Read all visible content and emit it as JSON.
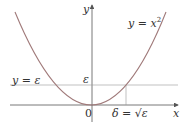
{
  "diagram": {
    "curve_label": "y = x",
    "curve_exp": "2",
    "hline_label": "y = ε",
    "y_axis_label": "y",
    "x_axis_label": "x",
    "eps_tick": "ε",
    "origin": "0",
    "delta_label": "δ = √ε"
  },
  "colors": {
    "curve": "#a07a7a",
    "axis": "#555555",
    "line": "#999999"
  }
}
